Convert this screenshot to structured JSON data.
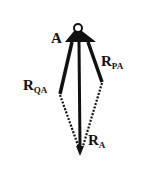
{
  "diagram": {
    "type": "force-vector-parallelogram",
    "point_label": "A",
    "vectors": [
      {
        "id": "rqa",
        "label_main": "R",
        "label_sub": "QA"
      },
      {
        "id": "rpa",
        "label_main": "R",
        "label_sub": "PA"
      },
      {
        "id": "ra",
        "label_main": "R",
        "label_sub": "A"
      }
    ],
    "colors": {
      "ink": "#111111",
      "background": "#ffffff"
    }
  }
}
